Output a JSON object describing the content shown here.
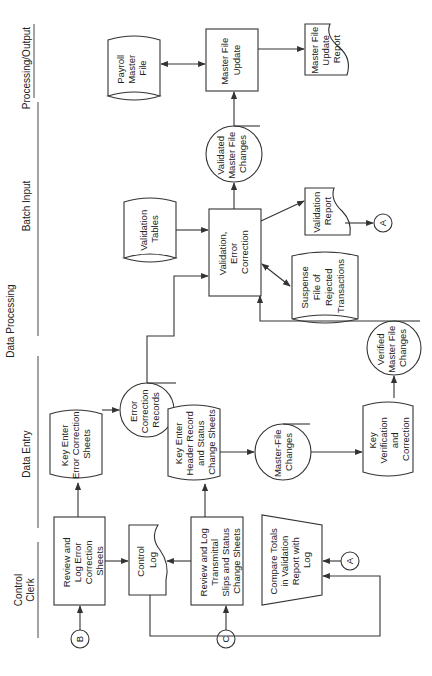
{
  "diagram": {
    "orientation": "rotated 90° counter-clockwise",
    "lane_group_header": "Data Processing",
    "lanes": [
      {
        "id": "control-clerk",
        "label": [
          "Control",
          "Clerk"
        ]
      },
      {
        "id": "data-entry",
        "label": [
          "Data Entry"
        ]
      },
      {
        "id": "batch-input",
        "label": [
          "Batch Input"
        ]
      },
      {
        "id": "processing-output",
        "label": [
          "Processing/Output"
        ]
      }
    ],
    "nodes": [
      {
        "id": "review-log-error",
        "type": "process",
        "lane": "control-clerk",
        "lines": [
          "Review and",
          "Log Error",
          "Correction",
          "Sheets"
        ]
      },
      {
        "id": "connector-b",
        "type": "connector",
        "lines": [
          "B"
        ]
      },
      {
        "id": "control-log",
        "type": "document",
        "lane": "control-clerk",
        "lines": [
          "Control",
          "Log"
        ]
      },
      {
        "id": "review-log-transmittal",
        "type": "process",
        "lane": "control-clerk",
        "lines": [
          "Review and Log",
          "Transmittal",
          "Slips and Status",
          "Change Sheets"
        ]
      },
      {
        "id": "connector-c",
        "type": "connector",
        "lines": [
          "C"
        ]
      },
      {
        "id": "compare-totals",
        "type": "manual-operation",
        "lane": "control-clerk",
        "lines": [
          "Compare Totals",
          "in Validation",
          "Report with",
          "Log"
        ]
      },
      {
        "id": "connector-a-in",
        "type": "connector",
        "lines": [
          "A"
        ]
      },
      {
        "id": "key-enter-error",
        "type": "offline-keying",
        "lane": "data-entry",
        "lines": [
          "Key Enter",
          "Error Correction",
          "Sheets"
        ]
      },
      {
        "id": "error-correction-records",
        "type": "data-circle",
        "lane": "data-entry",
        "lines": [
          "Error",
          "Correction",
          "Records"
        ]
      },
      {
        "id": "key-enter-header",
        "type": "offline-keying",
        "lane": "data-entry",
        "lines": [
          "Key Enter",
          "Header Record",
          "and Status",
          "Change Sheets"
        ]
      },
      {
        "id": "master-file-changes",
        "type": "data-circle",
        "lane": "data-entry",
        "lines": [
          "Master-File",
          "Changes"
        ]
      },
      {
        "id": "key-verification",
        "type": "offline-keying",
        "lane": "data-entry",
        "lines": [
          "Key",
          "Verification",
          "and",
          "Correction"
        ]
      },
      {
        "id": "verified-master-file-changes",
        "type": "data-circle",
        "lane": "data-entry",
        "lines": [
          "Verified",
          "Master File",
          "Changes"
        ]
      },
      {
        "id": "validation-tables",
        "type": "storage",
        "lane": "batch-input",
        "lines": [
          "Validation",
          "Tables"
        ]
      },
      {
        "id": "validation-error-correction",
        "type": "process",
        "lane": "batch-input",
        "lines": [
          "Validation,",
          "Error",
          "Correction"
        ]
      },
      {
        "id": "suspense-file",
        "type": "storage",
        "lane": "batch-input",
        "lines": [
          "Suspense",
          "File of",
          "Rejected",
          "Transactions"
        ]
      },
      {
        "id": "validation-report",
        "type": "document",
        "lane": "batch-input",
        "lines": [
          "Validation",
          "Report"
        ]
      },
      {
        "id": "connector-a-out",
        "type": "connector",
        "lines": [
          "A"
        ]
      },
      {
        "id": "validated-master-file-changes",
        "type": "data-circle",
        "lane": "batch-input",
        "lines": [
          "Validated",
          "Master File",
          "Changes"
        ]
      },
      {
        "id": "payroll-master-file",
        "type": "storage",
        "lane": "processing-output",
        "lines": [
          "Payroll",
          "Master",
          "File"
        ]
      },
      {
        "id": "master-file-update",
        "type": "process",
        "lane": "processing-output",
        "lines": [
          "Master File",
          "Update"
        ]
      },
      {
        "id": "master-file-update-report",
        "type": "document",
        "lane": "processing-output",
        "lines": [
          "Master File",
          "Update",
          "Report"
        ]
      }
    ],
    "edges": [
      [
        "connector-b",
        "review-log-error"
      ],
      [
        "review-log-error",
        "key-enter-error"
      ],
      [
        "review-log-error",
        "control-log"
      ],
      [
        "key-enter-error",
        "error-correction-records"
      ],
      [
        "error-correction-records",
        "validation-error-correction"
      ],
      [
        "connector-c",
        "review-log-transmittal"
      ],
      [
        "review-log-transmittal",
        "control-log"
      ],
      [
        "review-log-transmittal",
        "key-enter-header"
      ],
      [
        "key-enter-header",
        "master-file-changes"
      ],
      [
        "master-file-changes",
        "key-verification"
      ],
      [
        "key-verification",
        "verified-master-file-changes"
      ],
      [
        "verified-master-file-changes",
        "validation-error-correction"
      ],
      [
        "control-log",
        "compare-totals"
      ],
      [
        "connector-a-in",
        "compare-totals"
      ],
      [
        "validation-tables",
        "validation-error-correction"
      ],
      [
        "validation-error-correction",
        "suspense-file",
        "bidirectional"
      ],
      [
        "validation-error-correction",
        "validation-report"
      ],
      [
        "validation-report",
        "connector-a-out"
      ],
      [
        "validation-error-correction",
        "validated-master-file-changes"
      ],
      [
        "validated-master-file-changes",
        "master-file-update"
      ],
      [
        "payroll-master-file",
        "master-file-update",
        "bidirectional"
      ],
      [
        "master-file-update",
        "master-file-update-report"
      ]
    ]
  }
}
